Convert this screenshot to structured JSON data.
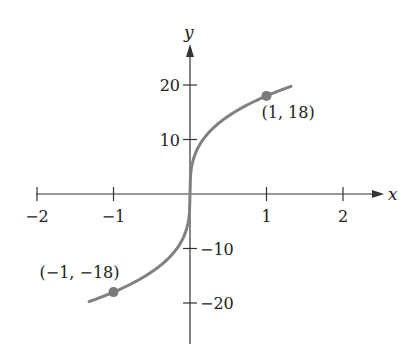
{
  "chart_data": {
    "type": "line",
    "title": "",
    "function": "y = 18 * cbrt(x)",
    "xlabel": "x",
    "ylabel": "y",
    "xlim": [
      -2,
      2
    ],
    "ylim": [
      -20,
      20
    ],
    "x_ticks": [
      -2,
      -1,
      1,
      2
    ],
    "x_tick_labels": [
      "−2",
      "−1",
      "1",
      "2"
    ],
    "y_ticks": [
      20,
      10,
      -10,
      -20
    ],
    "y_tick_labels": [
      "20",
      "10",
      "−10",
      "−20"
    ],
    "grid": false,
    "legend": null,
    "series": [
      {
        "name": "curve",
        "color": "#808080",
        "x_range": [
          -1.32,
          1.32
        ]
      }
    ],
    "points": [
      {
        "x": 1,
        "y": 18,
        "label": "(1, 18)"
      },
      {
        "x": -1,
        "y": -18,
        "label": "(−1, −18)"
      }
    ]
  },
  "colors": {
    "axis": "#333333",
    "curve": "#808080",
    "point": "#7a7a7a"
  }
}
